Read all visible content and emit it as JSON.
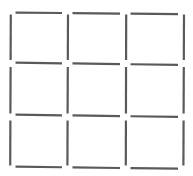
{
  "diagram": {
    "title": "",
    "grid": {
      "rows": 3,
      "cols": 3
    },
    "stick_color": "#5a5a5a",
    "horizontal_sticks": [
      {
        "row": 0,
        "col": 0
      },
      {
        "row": 0,
        "col": 1
      },
      {
        "row": 0,
        "col": 2
      },
      {
        "row": 1,
        "col": 0
      },
      {
        "row": 1,
        "col": 1
      },
      {
        "row": 1,
        "col": 2
      },
      {
        "row": 2,
        "col": 0
      },
      {
        "row": 2,
        "col": 1
      },
      {
        "row": 2,
        "col": 2
      },
      {
        "row": 3,
        "col": 0
      },
      {
        "row": 3,
        "col": 1
      },
      {
        "row": 3,
        "col": 2
      }
    ],
    "vertical_sticks": [
      {
        "row": 0,
        "col": 0
      },
      {
        "row": 1,
        "col": 0
      },
      {
        "row": 2,
        "col": 0
      },
      {
        "row": 0,
        "col": 1
      },
      {
        "row": 1,
        "col": 1
      },
      {
        "row": 2,
        "col": 1
      },
      {
        "row": 0,
        "col": 2
      },
      {
        "row": 1,
        "col": 2
      },
      {
        "row": 2,
        "col": 2
      },
      {
        "row": 0,
        "col": 3
      },
      {
        "row": 1,
        "col": 3
      },
      {
        "row": 2,
        "col": 3
      }
    ],
    "stick_count": 24
  }
}
